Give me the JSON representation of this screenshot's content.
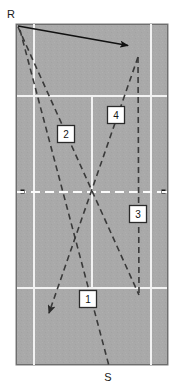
{
  "figure": {
    "type": "tennis-court-shot-diagram",
    "court": {
      "surface_color": "#a9a9a9",
      "line_color": "#f2f2f2",
      "border_color": "#6e6e6e",
      "x": 16,
      "y": 24,
      "width": 152,
      "height": 341,
      "singles_sideline_left_x": 34,
      "singles_sideline_right_x": 151,
      "center_service_line_x": 92,
      "service_line_top_y": 96,
      "service_line_bottom_y": 288,
      "net_line_y": 192,
      "net_post_left": {
        "x": 22,
        "y": 192
      },
      "net_post_right": {
        "x": 164,
        "y": 192
      },
      "net_post_color": "#1a1a1a"
    },
    "players": [
      {
        "id": "receiver",
        "label": "R",
        "x": 7,
        "y": 14
      },
      {
        "id": "server",
        "label": "S",
        "x": 103,
        "y": 368
      }
    ],
    "movement_arrow": {
      "name": "receiver-movement-arrow",
      "style": "solid",
      "color": "#111111",
      "from": {
        "x": 18,
        "y": 26
      },
      "to": {
        "x": 130,
        "y": 46
      }
    },
    "shots": [
      {
        "number": "1",
        "style": "dashed",
        "color": "#3a3a3a",
        "label_box": {
          "x": 79,
          "y": 290,
          "width": 18,
          "height": 18
        },
        "path": [
          [
            19,
            28
          ],
          [
            109,
            366
          ]
        ]
      },
      {
        "number": "2",
        "style": "dashed",
        "color": "#3a3a3a",
        "label_box": {
          "x": 57,
          "y": 125,
          "width": 18,
          "height": 18
        },
        "path": [
          [
            18,
            27
          ],
          [
            139,
            295
          ]
        ]
      },
      {
        "number": "3",
        "style": "dashed",
        "color": "#3a3a3a",
        "label_box": {
          "x": 129,
          "y": 205,
          "width": 18,
          "height": 18
        },
        "path": [
          [
            138,
            57
          ],
          [
            139,
            295
          ]
        ]
      },
      {
        "number": "4",
        "style": "dashed",
        "color": "#3a3a3a",
        "arrowhead": true,
        "label_box": {
          "x": 107,
          "y": 106,
          "width": 18,
          "height": 18
        },
        "path": [
          [
            138,
            57
          ],
          [
            47,
            316
          ]
        ]
      }
    ],
    "label_box_style": {
      "fill": "#ffffff",
      "stroke": "#2b2b2b"
    }
  }
}
